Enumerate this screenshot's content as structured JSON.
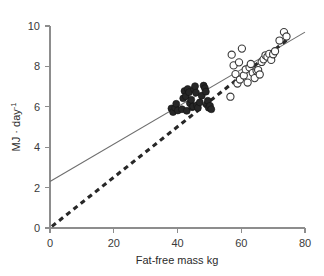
{
  "chart_data": {
    "type": "scatter",
    "title": "",
    "subtitle": "",
    "xlabel": "Fat-free mass kg",
    "ylabel": "MJ · day⁻¹",
    "ylabel_base": "MJ · day",
    "ylabel_exponent": "-1",
    "xlim": [
      0,
      80
    ],
    "ylim": [
      0,
      10
    ],
    "xticks": [
      0,
      20,
      40,
      60,
      80
    ],
    "yticks": [
      0,
      2,
      4,
      6,
      8,
      10
    ],
    "xtick_labels": [
      "0",
      "20",
      "40",
      "60",
      "80"
    ],
    "ytick_labels": [
      "0",
      "2",
      "4",
      "6",
      "8",
      "10"
    ],
    "grid": false,
    "legend_position": "none",
    "series": [
      {
        "name": "filled-circles",
        "marker": "filled-circle",
        "color": "#262626",
        "points": [
          [
            38.1,
            5.92
          ],
          [
            38.6,
            5.74
          ],
          [
            39.3,
            5.95
          ],
          [
            39.6,
            6.15
          ],
          [
            40.1,
            5.82
          ],
          [
            41.4,
            5.88
          ],
          [
            41.8,
            6.42
          ],
          [
            42.2,
            6.78
          ],
          [
            42.6,
            6.52
          ],
          [
            42.9,
            5.8
          ],
          [
            43.2,
            6.88
          ],
          [
            43.6,
            6.72
          ],
          [
            43.9,
            6.18
          ],
          [
            44.3,
            6.35
          ],
          [
            44.6,
            5.98
          ],
          [
            44.9,
            6.02
          ],
          [
            45.2,
            6.86
          ],
          [
            45.5,
            7.02
          ],
          [
            45.8,
            6.7
          ],
          [
            46.1,
            6.08
          ],
          [
            46.4,
            5.95
          ],
          [
            47.0,
            6.22
          ],
          [
            47.6,
            6.55
          ],
          [
            48.2,
            7.05
          ],
          [
            48.6,
            6.92
          ],
          [
            48.9,
            6.75
          ],
          [
            49.2,
            6.12
          ],
          [
            49.5,
            6.3
          ],
          [
            49.8,
            5.95
          ],
          [
            50.2,
            6.05
          ],
          [
            50.6,
            5.88
          ]
        ]
      },
      {
        "name": "open-circles",
        "marker": "open-circle",
        "color": "#3a3a3a",
        "points": [
          [
            56.6,
            6.5
          ],
          [
            57.0,
            8.58
          ],
          [
            57.6,
            8.05
          ],
          [
            58.2,
            7.62
          ],
          [
            58.8,
            7.15
          ],
          [
            59.3,
            8.2
          ],
          [
            59.6,
            7.35
          ],
          [
            60.2,
            8.88
          ],
          [
            60.8,
            7.55
          ],
          [
            61.4,
            7.85
          ],
          [
            62.0,
            7.2
          ],
          [
            62.6,
            7.95
          ],
          [
            63.0,
            8.12
          ],
          [
            63.6,
            7.68
          ],
          [
            64.2,
            7.42
          ],
          [
            64.8,
            7.78
          ],
          [
            65.3,
            7.82
          ],
          [
            65.8,
            7.6
          ],
          [
            66.4,
            8.22
          ],
          [
            67.0,
            8.35
          ],
          [
            67.6,
            8.55
          ],
          [
            68.2,
            8.48
          ],
          [
            68.8,
            8.62
          ],
          [
            69.4,
            8.32
          ],
          [
            70.0,
            8.6
          ],
          [
            70.6,
            8.75
          ],
          [
            72.0,
            9.28
          ],
          [
            73.4,
            9.7
          ],
          [
            74.2,
            9.48
          ]
        ]
      }
    ],
    "fit_lines": [
      {
        "name": "solid-regression-line",
        "style": "solid",
        "color": "#6e6e6e",
        "intercept": 2.3,
        "slope": 0.0925,
        "x_start": 0,
        "x_end": 80,
        "y_start": 2.3,
        "y_end": 9.7
      },
      {
        "name": "dashed-regression-line",
        "style": "dashed",
        "color": "#272727",
        "intercept": 0.0,
        "slope": 0.1253,
        "x_start": 0.6,
        "x_end": 75.0,
        "y_start": 0.08,
        "y_end": 9.4
      }
    ]
  }
}
